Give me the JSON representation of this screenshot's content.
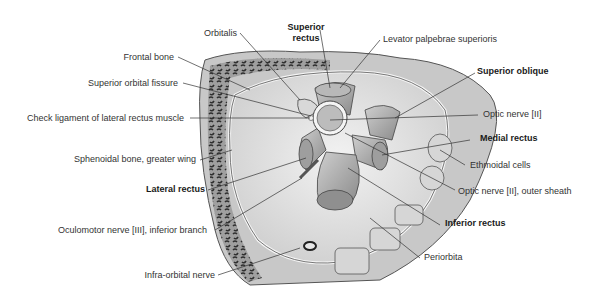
{
  "figure": {
    "colors": {
      "background": "#ffffff",
      "bone": "#bdbdbd",
      "bone_trabeculae": "#2b2b2b",
      "orbit_fat": "#e3e3e3",
      "muscle": "#a9a9a9",
      "leader_line": "#333333",
      "label_text": "#333333"
    }
  },
  "labels": {
    "orbitalis": "Orbitalis",
    "superior_rectus_1": "Superior",
    "superior_rectus_2": "rectus",
    "levator": "Levator palpebrae superioris",
    "frontal_bone": "Frontal bone",
    "superior_orbital_fissure": "Superior orbital fissure",
    "superior_oblique": "Superior oblique",
    "check_ligament": "Check ligament of lateral rectus muscle",
    "optic_nerve": "Optic nerve [II]",
    "medial_rectus": "Medial rectus",
    "sphenoidal_bone": "Sphenoidal bone, greater wing",
    "ethmoidal_cells": "Ethmoidal cells",
    "lateral_rectus": "Lateral rectus",
    "optic_nerve_sheath": "Optic nerve [II], outer sheath",
    "oculomotor_nerve": "Oculomotor nerve [III], inferior branch",
    "inferior_rectus": "Inferior rectus",
    "periorbita": "Periorbita",
    "infraorbital_nerve": "Infra-orbital nerve"
  }
}
